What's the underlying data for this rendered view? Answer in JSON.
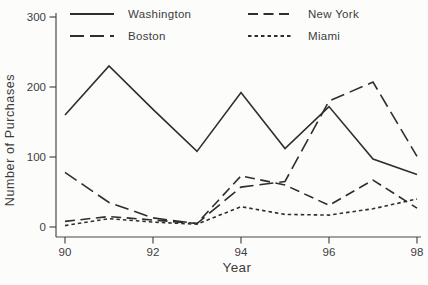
{
  "figure": {
    "background": "#fcfcfb",
    "stroke_color": "#2e2e2e",
    "axis_color": "#4a4a4a",
    "text_color": "#3c3c3c"
  },
  "chart_data": {
    "type": "line",
    "title": "",
    "xlabel": "Year",
    "ylabel": "Number of Purchases",
    "x": [
      90,
      91,
      92,
      93,
      94,
      95,
      96,
      97,
      98
    ],
    "x_ticks": [
      90,
      92,
      94,
      96,
      98
    ],
    "y_ticks": [
      0,
      100,
      200,
      300
    ],
    "xlim": [
      90,
      98
    ],
    "ylim": [
      0,
      300
    ],
    "grid": false,
    "legend_position": "top",
    "series": [
      {
        "name": "Washington",
        "dash": "solid",
        "values": [
          160,
          230,
          168,
          108,
          192,
          112,
          172,
          97,
          75
        ]
      },
      {
        "name": "Boston",
        "dash": "long-dash",
        "values": [
          78,
          35,
          13,
          5,
          57,
          65,
          180,
          207,
          101
        ]
      },
      {
        "name": "New York",
        "dash": "dash",
        "values": [
          8,
          15,
          10,
          5,
          73,
          60,
          31,
          67,
          27
        ]
      },
      {
        "name": "Miami",
        "dash": "short-dash",
        "values": [
          2,
          12,
          7,
          4,
          29,
          18,
          17,
          26,
          40
        ]
      }
    ]
  }
}
